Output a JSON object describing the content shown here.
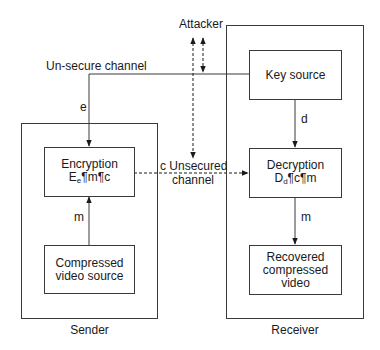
{
  "containers": {
    "sender": {
      "label": "Sender"
    },
    "receiver": {
      "label": "Receiver"
    }
  },
  "nodes": {
    "encryption": {
      "line1": "Encryption",
      "func": "E",
      "sub": "e",
      "expr": "¶m¶c"
    },
    "compressed_source": {
      "line1": "Compressed",
      "line2": "video source"
    },
    "key_source": {
      "line1": "Key source"
    },
    "decryption": {
      "line1": "Decryption",
      "func": "D",
      "sub": "d",
      "expr": "¶c¶m"
    },
    "recovered": {
      "line1": "Recovered",
      "line2": "compressed",
      "line3": "video"
    }
  },
  "edges": {
    "unsecure_channel": {
      "label": "Un-secure channel"
    },
    "key_e": {
      "label": "e"
    },
    "key_d": {
      "label": "d"
    },
    "msg_sender": {
      "label": "m"
    },
    "msg_receiver": {
      "label": "m"
    },
    "cipher": {
      "label1": "c Unsecured",
      "label2": "channel"
    },
    "attacker": {
      "label": "Attacker"
    }
  },
  "colors": {
    "line": "#3a3a3a",
    "text": "#1a1a1a",
    "background": "#ffffff"
  }
}
